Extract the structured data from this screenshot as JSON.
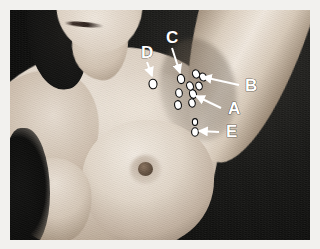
{
  "figure": {
    "type": "clinical-photograph",
    "plate_background_color": "#f2f1ee",
    "photo_background_color": "#0d0d0c",
    "marker_fill_color": "#ffffff",
    "marker_stroke_color": "#0a0a0a",
    "leader_color": "#ffffff",
    "label_text_color": "#ffffff"
  },
  "annotations": [
    {
      "id": "label-a",
      "letter": "A",
      "letter_x": 228,
      "letter_y": 114,
      "leader": {
        "x1": 221,
        "y1": 108,
        "x2": 196,
        "y2": 96
      },
      "markers": [
        {
          "cx": 193,
          "cy": 94,
          "rx": 3.4,
          "ry": 4.4,
          "rot": -18
        },
        {
          "cx": 192,
          "cy": 103,
          "rx": 3.2,
          "ry": 4.2,
          "rot": -14
        },
        {
          "cx": 190,
          "cy": 86,
          "rx": 3.3,
          "ry": 4.3,
          "rot": -20
        }
      ]
    },
    {
      "id": "label-b",
      "letter": "B",
      "letter_x": 245,
      "letter_y": 91,
      "leader": {
        "x1": 239,
        "y1": 85,
        "x2": 203,
        "y2": 77
      },
      "markers": [
        {
          "cx": 196,
          "cy": 74,
          "rx": 3.4,
          "ry": 4.2,
          "rot": -25
        },
        {
          "cx": 203,
          "cy": 77,
          "rx": 3.3,
          "ry": 4.1,
          "rot": -25
        },
        {
          "cx": 199,
          "cy": 86,
          "rx": 3.2,
          "ry": 4.0,
          "rot": -20
        }
      ]
    },
    {
      "id": "label-c",
      "letter": "C",
      "letter_x": 166,
      "letter_y": 43,
      "leader": {
        "x1": 172,
        "y1": 48,
        "x2": 180,
        "y2": 73
      },
      "markers": [
        {
          "cx": 181,
          "cy": 79,
          "rx": 3.6,
          "ry": 4.6,
          "rot": -10
        },
        {
          "cx": 179,
          "cy": 93,
          "rx": 3.3,
          "ry": 4.3,
          "rot": -10
        },
        {
          "cx": 178,
          "cy": 105,
          "rx": 3.4,
          "ry": 4.4,
          "rot": -10
        }
      ]
    },
    {
      "id": "label-d",
      "letter": "D",
      "letter_x": 141,
      "letter_y": 58,
      "leader": {
        "x1": 147,
        "y1": 62,
        "x2": 152,
        "y2": 76
      },
      "markers": [
        {
          "cx": 153,
          "cy": 84,
          "rx": 4.0,
          "ry": 4.8,
          "rot": -8
        }
      ]
    },
    {
      "id": "label-e",
      "letter": "E",
      "letter_x": 226,
      "letter_y": 137,
      "leader": {
        "x1": 219,
        "y1": 132,
        "x2": 199,
        "y2": 131
      },
      "markers": [
        {
          "cx": 195,
          "cy": 122,
          "rx": 2.6,
          "ry": 3.4,
          "rot": 0
        },
        {
          "cx": 195,
          "cy": 132,
          "rx": 3.4,
          "ry": 4.2,
          "rot": 0
        }
      ]
    }
  ]
}
